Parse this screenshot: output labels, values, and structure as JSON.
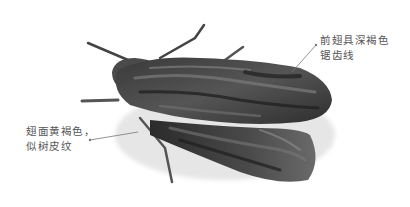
{
  "figure": {
    "annotations": [
      {
        "id": "forewing",
        "lines": [
          "前翅具深褐色",
          "锯齿线"
        ]
      },
      {
        "id": "wing-surface",
        "lines": [
          "翅面黄褐色，",
          "似树皮纹"
        ]
      }
    ],
    "colors": {
      "background": "#ffffff",
      "moth_dark": "#2a2a2a",
      "moth_mid": "#5a5a5a",
      "moth_light": "#9a9a9a",
      "leader_line": "#777777",
      "label_text": "#555555"
    }
  }
}
